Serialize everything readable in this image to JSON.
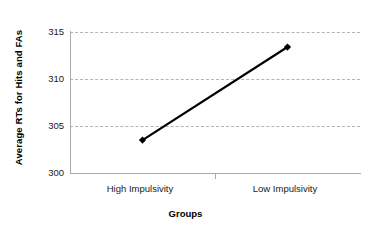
{
  "chart_data": {
    "type": "line",
    "title": "",
    "xlabel": "Groups",
    "ylabel": "Average RTs for Hits and FAs",
    "categories": [
      "High Impulsivity",
      "Low Impulsivity"
    ],
    "values": [
      303.5,
      313.4
    ],
    "series": [
      {
        "name": "Average RTs",
        "values": [
          303.5,
          313.4
        ]
      }
    ],
    "ylim": [
      300,
      315
    ],
    "yticks": [
      300,
      305,
      310,
      315
    ],
    "ytick_labels": [
      "300",
      "305",
      "310",
      "315"
    ],
    "grid": true,
    "gridlines_at": [
      305,
      310,
      315
    ],
    "legend": false,
    "legend_position": "none",
    "marker": "diamond",
    "line_color": "#000000",
    "marker_color": "#000000",
    "grid_color": "#b4b4b4",
    "axis_color": "#aaaaaa",
    "background_color": "#ffffff"
  },
  "axes": {
    "y_title": "Average RTs for Hits and FAs",
    "x_title": "Groups",
    "y_labels": [
      "315",
      "310",
      "305",
      "300"
    ],
    "x_labels": [
      "High Impulsivity",
      "Low Impulsivity"
    ]
  }
}
